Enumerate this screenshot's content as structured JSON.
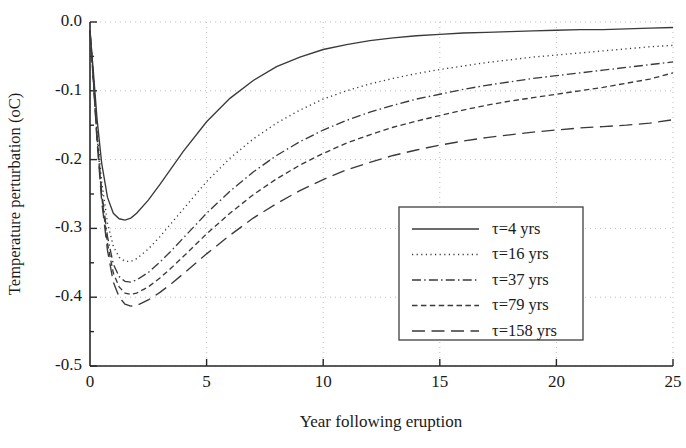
{
  "chart_data": {
    "type": "line",
    "title": "",
    "xlabel": "Year following eruption",
    "ylabel": "Temperature perturbation (oC)",
    "xlim": [
      0,
      25
    ],
    "ylim": [
      -0.5,
      0.0
    ],
    "grid": true,
    "legend_position": "lower right",
    "xticks": [
      0,
      5,
      10,
      15,
      20,
      25
    ],
    "xtick_labels": [
      "0",
      "5",
      "10",
      "15",
      "20",
      "25"
    ],
    "yticks": [
      0.0,
      -0.1,
      -0.2,
      -0.3,
      -0.4,
      -0.5
    ],
    "ytick_labels": [
      "0.0",
      "-0.1",
      "-0.2",
      "-0.3",
      "-0.4",
      "-0.5"
    ],
    "x": [
      0,
      0.15,
      0.3,
      0.5,
      0.75,
      1.0,
      1.25,
      1.5,
      1.75,
      2.0,
      2.5,
      3.0,
      3.5,
      4.0,
      5.0,
      6.0,
      7.0,
      8.0,
      9.0,
      10.0,
      11.0,
      12.0,
      13.0,
      14.0,
      15.0,
      16.0,
      17.0,
      18.0,
      19.0,
      20.0,
      21.0,
      22.0,
      23.0,
      24.0,
      25.0
    ],
    "series": [
      {
        "name": "τ=4 yrs",
        "tau": 4,
        "dash": "solid",
        "values": [
          -0.012,
          -0.075,
          -0.14,
          -0.205,
          -0.255,
          -0.278,
          -0.286,
          -0.288,
          -0.285,
          -0.278,
          -0.259,
          -0.236,
          -0.212,
          -0.188,
          -0.145,
          -0.111,
          -0.085,
          -0.065,
          -0.051,
          -0.04,
          -0.033,
          -0.027,
          -0.023,
          -0.02,
          -0.018,
          -0.016,
          -0.015,
          -0.014,
          -0.013,
          -0.012,
          -0.011,
          -0.011,
          -0.01,
          -0.009,
          -0.008
        ]
      },
      {
        "name": "τ=16 yrs",
        "tau": 16,
        "dash": "dotted",
        "values": [
          -0.012,
          -0.082,
          -0.155,
          -0.232,
          -0.292,
          -0.326,
          -0.342,
          -0.348,
          -0.348,
          -0.344,
          -0.33,
          -0.312,
          -0.292,
          -0.272,
          -0.232,
          -0.198,
          -0.17,
          -0.147,
          -0.128,
          -0.112,
          -0.1,
          -0.09,
          -0.082,
          -0.075,
          -0.069,
          -0.064,
          -0.059,
          -0.055,
          -0.051,
          -0.048,
          -0.045,
          -0.042,
          -0.039,
          -0.036,
          -0.034
        ]
      },
      {
        "name": "τ=37 yrs",
        "tau": 37,
        "dash": "dashdot",
        "values": [
          -0.012,
          -0.086,
          -0.164,
          -0.247,
          -0.312,
          -0.352,
          -0.37,
          -0.377,
          -0.378,
          -0.375,
          -0.364,
          -0.349,
          -0.332,
          -0.314,
          -0.278,
          -0.246,
          -0.218,
          -0.194,
          -0.174,
          -0.157,
          -0.143,
          -0.131,
          -0.121,
          -0.112,
          -0.105,
          -0.098,
          -0.092,
          -0.087,
          -0.082,
          -0.078,
          -0.074,
          -0.07,
          -0.066,
          -0.062,
          -0.058
        ]
      },
      {
        "name": "τ=79 yrs",
        "tau": 79,
        "dash": "dashed",
        "values": [
          -0.012,
          -0.088,
          -0.168,
          -0.253,
          -0.322,
          -0.365,
          -0.385,
          -0.394,
          -0.396,
          -0.394,
          -0.385,
          -0.372,
          -0.357,
          -0.341,
          -0.308,
          -0.278,
          -0.251,
          -0.228,
          -0.208,
          -0.191,
          -0.176,
          -0.164,
          -0.153,
          -0.144,
          -0.136,
          -0.128,
          -0.121,
          -0.115,
          -0.11,
          -0.105,
          -0.1,
          -0.095,
          -0.089,
          -0.083,
          -0.074
        ]
      },
      {
        "name": "τ=158 yrs",
        "tau": 158,
        "dash": "longdash",
        "values": [
          -0.012,
          -0.09,
          -0.172,
          -0.26,
          -0.332,
          -0.378,
          -0.4,
          -0.41,
          -0.413,
          -0.412,
          -0.404,
          -0.393,
          -0.38,
          -0.366,
          -0.337,
          -0.31,
          -0.285,
          -0.264,
          -0.245,
          -0.229,
          -0.215,
          -0.204,
          -0.194,
          -0.186,
          -0.179,
          -0.173,
          -0.168,
          -0.164,
          -0.16,
          -0.157,
          -0.154,
          -0.152,
          -0.15,
          -0.147,
          -0.142
        ]
      }
    ]
  },
  "legend": {
    "entries": [
      {
        "label": "τ=4 yrs"
      },
      {
        "label": "τ=16 yrs"
      },
      {
        "label": "τ=37 yrs"
      },
      {
        "label": "τ=79 yrs"
      },
      {
        "label": "τ=158 yrs"
      }
    ]
  },
  "axes": {
    "x_title": "Year following eruption",
    "y_title": "Temperature perturbation (oC)",
    "x_tick_labels": [
      "0",
      "5",
      "10",
      "15",
      "20",
      "25"
    ],
    "y_tick_labels": [
      "0.0",
      "-0.1",
      "-0.2",
      "-0.3",
      "-0.4",
      "-0.5"
    ]
  },
  "colors": {
    "line": "#3a3a3a",
    "axis": "#262626",
    "grid": "#bdbdbd",
    "background": "#ffffff"
  }
}
